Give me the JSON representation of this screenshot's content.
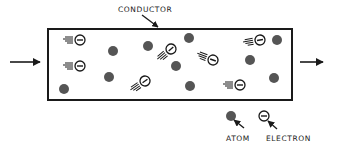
{
  "diagram": {
    "labels": {
      "conductor": "CONDUCTOR",
      "atom": "ATOM",
      "electron": "ELECTRON"
    },
    "colors": {
      "stroke": "#1a1a1a",
      "atom_fill": "#555555",
      "background": "#ffffff"
    },
    "conductor_box": {
      "x": 48,
      "y": 29,
      "width": 244,
      "height": 71
    },
    "atoms": [
      {
        "x": 113,
        "y": 51
      },
      {
        "x": 109,
        "y": 77
      },
      {
        "x": 64,
        "y": 89
      },
      {
        "x": 148,
        "y": 46
      },
      {
        "x": 176,
        "y": 66
      },
      {
        "x": 189,
        "y": 38
      },
      {
        "x": 190,
        "y": 86
      },
      {
        "x": 277,
        "y": 40
      },
      {
        "x": 250,
        "y": 60
      },
      {
        "x": 274,
        "y": 78
      }
    ],
    "electrons": [
      {
        "x": 80,
        "y": 40,
        "angle": 0
      },
      {
        "x": 80,
        "y": 66,
        "angle": 0
      },
      {
        "x": 171,
        "y": 49,
        "angle": -40
      },
      {
        "x": 213,
        "y": 60,
        "angle": 20
      },
      {
        "x": 145,
        "y": 81,
        "angle": -35
      },
      {
        "x": 260,
        "y": 40,
        "angle": -10
      },
      {
        "x": 240,
        "y": 85,
        "angle": 0
      }
    ],
    "flow_arrows": [
      "input-arrow-left",
      "output-arrow-right"
    ]
  }
}
